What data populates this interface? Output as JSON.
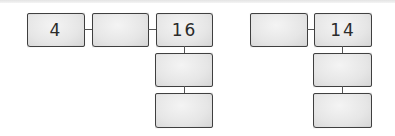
{
  "diagram": {
    "line_color": "#555555",
    "box_fill": "#e6e6e6",
    "box_border": "#4a4a4a",
    "left_group": {
      "row": [
        {
          "value": "4"
        },
        {
          "value": ""
        },
        {
          "value": "16"
        }
      ],
      "column_below": [
        {
          "value": ""
        },
        {
          "value": ""
        }
      ]
    },
    "right_group": {
      "row": [
        {
          "value": ""
        },
        {
          "value": "14"
        }
      ],
      "column_below": [
        {
          "value": ""
        },
        {
          "value": ""
        }
      ]
    }
  }
}
